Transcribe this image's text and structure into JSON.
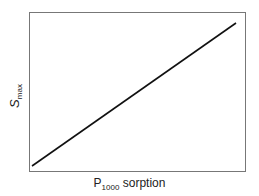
{
  "chart_data": {
    "type": "line",
    "title": "",
    "xlabel": "P1000 sorption",
    "ylabel": "Smax",
    "x_axis": {
      "label_main": "P",
      "label_sub": "1000",
      "label_rest": " sorption",
      "ticks": []
    },
    "y_axis": {
      "label_main": "S",
      "label_sub": "max",
      "ticks": []
    },
    "series": [
      {
        "name": "Smax vs P1000 sorption",
        "x": [
          0,
          1
        ],
        "y": [
          0,
          1
        ],
        "color": "#111111"
      }
    ],
    "xlim": [
      0,
      1
    ],
    "ylim": [
      0,
      1
    ],
    "grid": false,
    "legend": null
  },
  "style": {
    "frame_color": "#777777",
    "line_color": "#111111"
  }
}
